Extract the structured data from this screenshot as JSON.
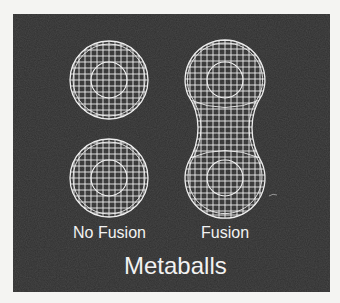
{
  "figure": {
    "title": "Metaballs",
    "panels": [
      {
        "id": "no-fusion",
        "label": "No Fusion",
        "description": "Two separate wireframe spheres"
      },
      {
        "id": "fusion",
        "label": "Fusion",
        "description": "Two wireframe spheres merged into a peanut-shaped blob"
      }
    ]
  },
  "colors": {
    "page_background": "#f4f4f2",
    "panel_background": "#2f2f2f",
    "wireframe": "#eeeeee",
    "text": "#f2f2f2"
  }
}
